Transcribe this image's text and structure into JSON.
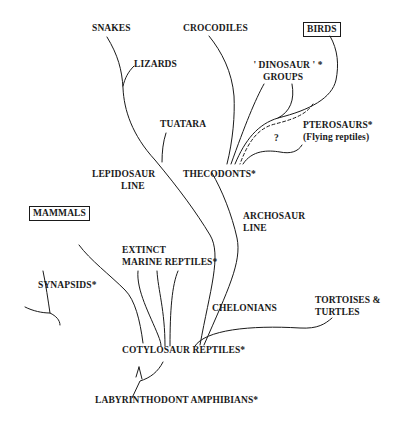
{
  "diagram": {
    "nodes": {
      "snakes": "SNAKES",
      "crocodiles": "CROCODILES",
      "birds": "BIRDS",
      "lizards": "LIZARDS",
      "dinosaur_groups_line1": "' DINOSAUR ' *",
      "dinosaur_groups_line2": "GROUPS",
      "tuatara": "TUATARA",
      "pterosaurs": "PTEROSAURS*",
      "pterosaurs_note": "(Flying reptiles)",
      "question_mark": "?",
      "lepidosaur_line1": "LEPIDOSAUR",
      "lepidosaur_line2": "LINE",
      "thecodonts": "THECODONTS*",
      "archosaur_line1": "ARCHOSAUR",
      "archosaur_line2": "LINE",
      "mammals": "MAMMALS",
      "extinct_marine_line1": "EXTINCT",
      "extinct_marine_line2": "MARINE REPTILES*",
      "synapsids": "SYNAPSIDS*",
      "chelonians": "CHELONIANS",
      "tortoises_line1": "TORTOISES &",
      "tortoises_line2": "TURTLES",
      "cotylosaur": "COTYLOSAUR REPTILES*",
      "labyrinthodont": "LABYRINTHODONT AMPHIBIANS*"
    },
    "boxed_nodes": [
      "BIRDS",
      "MAMMALS"
    ],
    "legend_note": "* = extinct group; boxed = living descendant classes"
  }
}
